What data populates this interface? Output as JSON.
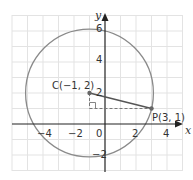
{
  "diagram": {
    "type": "coordinate-plane-circle",
    "axes": {
      "x_label": "x",
      "y_label": "y",
      "x_range": [
        -6,
        5
      ],
      "y_range": [
        -3,
        7
      ],
      "x_ticks": [
        {
          "value": -4,
          "label": "−4"
        },
        {
          "value": -2,
          "label": "−2"
        },
        {
          "value": 0,
          "label": "0"
        },
        {
          "value": 2,
          "label": "2"
        },
        {
          "value": 4,
          "label": "4"
        }
      ],
      "y_ticks": [
        {
          "value": 6,
          "label": "6"
        },
        {
          "value": 4,
          "label": "4"
        },
        {
          "value": 2,
          "label": "2"
        },
        {
          "value": -2,
          "label": "−2"
        }
      ],
      "grid": true
    },
    "circle": {
      "center": [
        -1,
        2
      ],
      "radius_squared": 17
    },
    "points": {
      "C": {
        "label": "C(−1, 2)",
        "x": -1,
        "y": 2
      },
      "P": {
        "label": "P(3, 1)",
        "x": 3,
        "y": 1
      }
    },
    "segments": [
      {
        "from": "C",
        "to": "P",
        "style": "solid"
      },
      {
        "from": [
          -1,
          2
        ],
        "to": [
          -1,
          1
        ],
        "style": "dashed"
      },
      {
        "from": [
          -1,
          1
        ],
        "to": [
          3,
          1
        ],
        "style": "dashed"
      }
    ],
    "right_angle_at": [
      -1,
      1
    ],
    "colors": {
      "grid": "#e3e3e3",
      "axis": "#222222",
      "circle": "#8a8a8a",
      "segment": "#555555",
      "dashed": "#777777"
    }
  }
}
